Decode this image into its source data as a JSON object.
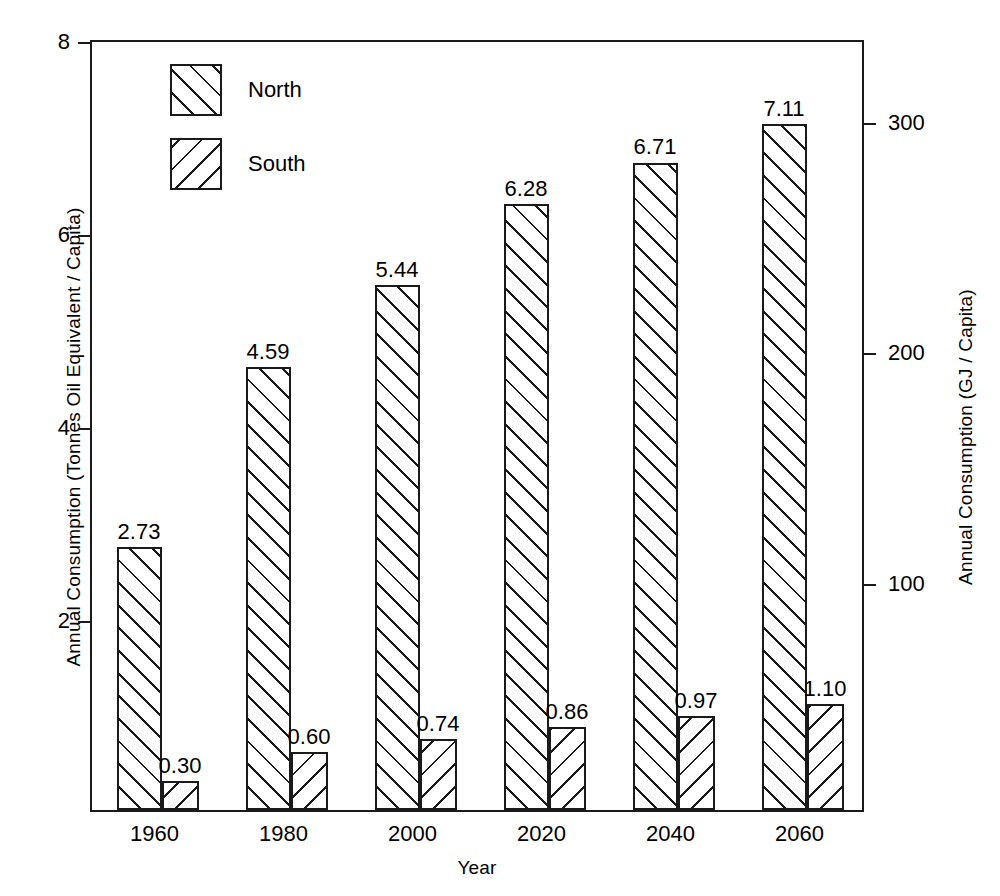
{
  "chart_data": {
    "type": "bar",
    "title": "",
    "subtitle": "",
    "xlabel": "Year",
    "ylabel": "Annual Consumption (Tonnes Oil Equivalent / Capita)",
    "y2label": "Annual Consumption (GJ / Capita)",
    "categories": [
      "1960",
      "1980",
      "2000",
      "2020",
      "2040",
      "2060"
    ],
    "series": [
      {
        "name": "North",
        "hatch": "forward-slash",
        "values": [
          2.73,
          4.59,
          5.44,
          6.28,
          6.71,
          7.11
        ],
        "labels": [
          "2.73",
          "4.59",
          "5.44",
          "6.28",
          "6.71",
          "7.11"
        ]
      },
      {
        "name": "South",
        "hatch": "back-slash",
        "values": [
          0.3,
          0.6,
          0.74,
          0.86,
          0.97,
          1.1
        ],
        "labels": [
          "0.30",
          "0.60",
          "0.74",
          "0.86",
          "0.97",
          "1.10"
        ]
      }
    ],
    "ylim": [
      0,
      8
    ],
    "yticks": [
      2,
      4,
      6,
      8
    ],
    "ytick_labels": [
      "2",
      "4",
      "6",
      "8"
    ],
    "y2lim": [
      0,
      335
    ],
    "y2ticks": [
      100,
      200,
      300
    ],
    "y2tick_labels": [
      "100",
      "200",
      "300"
    ],
    "grid": false,
    "legend_position": "upper-left-inside",
    "colors": {
      "line": "#1a1a1a",
      "fill": "#ffffff",
      "text": "#000000"
    }
  },
  "legend": {
    "items": [
      {
        "label": "North"
      },
      {
        "label": "South"
      }
    ]
  }
}
